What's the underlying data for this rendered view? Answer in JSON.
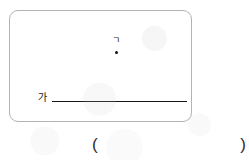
{
  "figure": {
    "frame": {
      "name": "rounded-rectangle-border",
      "border_color": "#b3b3b6",
      "corner_radius_px": 9
    },
    "point": {
      "label": "ㄱ",
      "marker": "filled-dot",
      "color": "#121212"
    },
    "line": {
      "label": "가",
      "color": "#17171a",
      "orientation": "horizontal"
    }
  },
  "answer": {
    "open_paren": "(",
    "close_paren": ")",
    "value": ""
  }
}
